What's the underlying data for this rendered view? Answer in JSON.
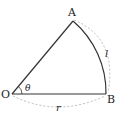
{
  "diagram": {
    "type": "circular-sector",
    "points": {
      "O": {
        "label": "O"
      },
      "A": {
        "label": "A"
      },
      "B": {
        "label": "B"
      }
    },
    "angle_label": "θ",
    "arc_length_label": "l",
    "radius_label": "r",
    "colors": {
      "stroke": "#333333",
      "dashed": "#aaaaaa"
    }
  }
}
